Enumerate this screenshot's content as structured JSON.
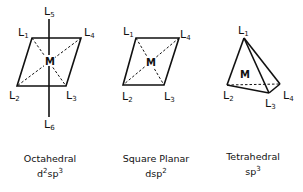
{
  "octahedral": {
    "caption": "Octahedral",
    "hybrid_base_1": "d",
    "hybrid_sup_1": "2",
    "hybrid_base_2": "sp",
    "hybrid_sup_2": "3",
    "center": "M",
    "ligands": {
      "l1": {
        "base": "L",
        "sub": "1"
      },
      "l2": {
        "base": "L",
        "sub": "2"
      },
      "l3": {
        "base": "L",
        "sub": "3"
      },
      "l4": {
        "base": "L",
        "sub": "4"
      },
      "l5": {
        "base": "L",
        "sub": "5"
      },
      "l6": {
        "base": "L",
        "sub": "6"
      }
    }
  },
  "square_planar": {
    "caption": "Square Planar",
    "hybrid_base": "dsp",
    "hybrid_sup": "2",
    "center": "M",
    "ligands": {
      "l1": {
        "base": "L",
        "sub": "1"
      },
      "l2": {
        "base": "L",
        "sub": "2"
      },
      "l3": {
        "base": "L",
        "sub": "3"
      },
      "l4": {
        "base": "L",
        "sub": "4"
      }
    }
  },
  "tetrahedral": {
    "caption": "Tetrahedral",
    "hybrid_base": "sp",
    "hybrid_sup": "3",
    "center": "M",
    "ligands": {
      "l1": {
        "base": "L",
        "sub": "1"
      },
      "l2": {
        "base": "L",
        "sub": "2"
      },
      "l3": {
        "base": "L",
        "sub": "3"
      },
      "l4": {
        "base": "L",
        "sub": "4"
      }
    }
  }
}
